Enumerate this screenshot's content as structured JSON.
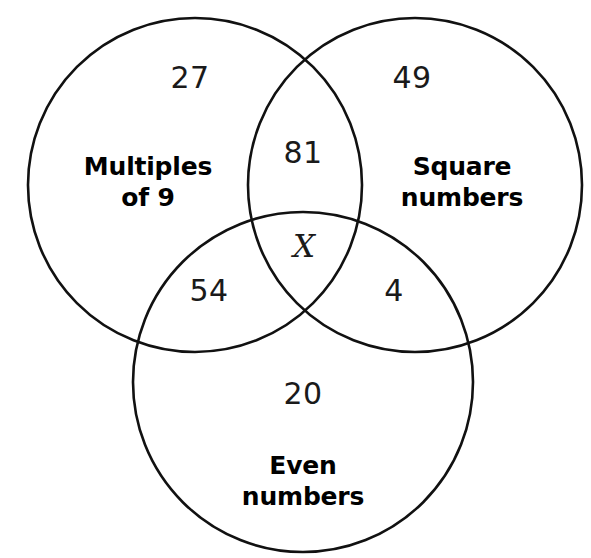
{
  "diagram": {
    "type": "venn-3-set",
    "background_color": "#ffffff",
    "stroke_color": "#111111",
    "text_color": "#1a1a1a"
  },
  "sets": [
    {
      "id": "multiples-of-9",
      "label_line1": "Multiples",
      "label_line2": "of 9",
      "label_x": 148,
      "label_y": 182,
      "circle": {
        "cx": 195,
        "cy": 185,
        "r": 167
      }
    },
    {
      "id": "square-numbers",
      "label_line1": "Square",
      "label_line2": "numbers",
      "label_x": 462,
      "label_y": 182,
      "circle": {
        "cx": 415,
        "cy": 185,
        "r": 167
      }
    },
    {
      "id": "even-numbers",
      "label_line1": "Even",
      "label_line2": "numbers",
      "label_x": 303,
      "label_y": 481,
      "circle": {
        "cx": 303,
        "cy": 382,
        "r": 170
      }
    }
  ],
  "regions": [
    {
      "id": "multiples-only",
      "value": "27",
      "x": 190,
      "y": 78,
      "style": "number"
    },
    {
      "id": "squares-only",
      "value": "49",
      "x": 412,
      "y": 78,
      "style": "number"
    },
    {
      "id": "multiples-and-squares",
      "value": "81",
      "x": 303,
      "y": 153,
      "style": "number"
    },
    {
      "id": "all-three",
      "value": "X",
      "x": 304,
      "y": 247,
      "style": "unknown"
    },
    {
      "id": "multiples-and-even",
      "value": "54",
      "x": 209,
      "y": 291,
      "style": "number"
    },
    {
      "id": "squares-and-even",
      "value": "4",
      "x": 394,
      "y": 291,
      "style": "number"
    },
    {
      "id": "even-only",
      "value": "20",
      "x": 303,
      "y": 394,
      "style": "number"
    }
  ]
}
